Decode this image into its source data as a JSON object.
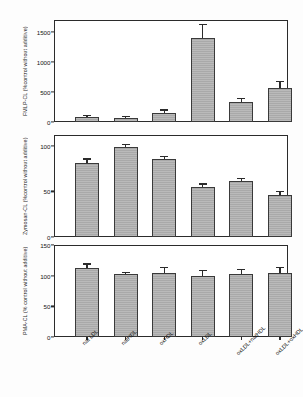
{
  "figure": {
    "categories": [
      "nat LDL",
      "natHDL",
      "oxHDL",
      "oxLDL",
      "oxLDL+natHDL",
      "oxLDL+oxHDL"
    ]
  },
  "chart_data": [
    {
      "type": "bar",
      "title": "",
      "panel": "top",
      "ylabel": "FMLP-CL (%control without additive)",
      "xlabel": "",
      "categories": [
        "nat LDL",
        "natHDL",
        "oxHDL",
        "oxLDL",
        "oxLDL+natHDL",
        "oxLDL+oxHDL"
      ],
      "values": [
        80,
        70,
        155,
        1395,
        335,
        560
      ],
      "errors": [
        22,
        18,
        35,
        225,
        45,
        110
      ],
      "ylim": [
        0,
        1700
      ],
      "yticks": [
        0,
        500,
        1000,
        1500
      ],
      "ytick_labels": [
        "0",
        "500",
        "1000",
        "1500"
      ],
      "grid": false,
      "legend": "none"
    },
    {
      "type": "bar",
      "title": "",
      "panel": "middle",
      "ylabel": "Zymosan-CL (%control without additive)",
      "xlabel": "",
      "categories": [
        "nat LDL",
        "natHDL",
        "oxHDL",
        "oxLDL",
        "oxLDL+natHDL",
        "oxLDL+oxHDL"
      ],
      "values": [
        81,
        99,
        86,
        55,
        62,
        46
      ],
      "errors": [
        4,
        1.5,
        2,
        2.5,
        2,
        3.5
      ],
      "ylim": [
        0,
        112
      ],
      "yticks": [
        0,
        50,
        100
      ],
      "ytick_labels": [
        "0",
        "50",
        "100"
      ],
      "grid": false,
      "legend": "none"
    },
    {
      "type": "bar",
      "title": "",
      "panel": "bottom",
      "ylabel": "PMA-CL (% control without additive)",
      "xlabel": "",
      "categories": [
        "nat LDL",
        "natHDL",
        "oxHDL",
        "oxLDL",
        "oxLDL+natHDL",
        "oxLDL+oxHDL"
      ],
      "values": [
        112,
        103,
        105,
        100,
        103,
        105
      ],
      "errors": [
        6,
        1.5,
        7,
        8,
        6,
        8
      ],
      "ylim": [
        0,
        150
      ],
      "yticks": [
        0,
        50,
        100,
        150
      ],
      "ytick_labels": [
        "0",
        "50",
        "100",
        "150"
      ],
      "grid": false,
      "legend": "none"
    }
  ]
}
